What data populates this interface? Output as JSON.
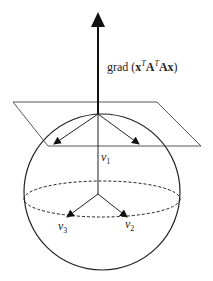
{
  "diagram": {
    "gradient_label": {
      "prefix": "grad (",
      "x": "x",
      "sup1": "T",
      "A1": "A",
      "sup2": "T",
      "A2": "A",
      "x2": "x",
      "suffix": ")"
    },
    "vectors": [
      {
        "name": "v",
        "sub": "1"
      },
      {
        "name": "v",
        "sub": "2"
      },
      {
        "name": "v",
        "sub": "3"
      }
    ],
    "colors": {
      "stroke": "#222222",
      "background": "#ffffff"
    }
  }
}
